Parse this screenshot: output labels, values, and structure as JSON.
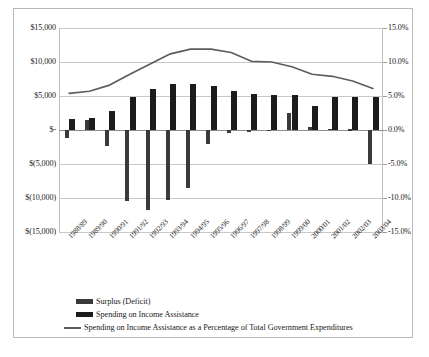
{
  "chart_data": {
    "type": "bar",
    "title": "",
    "xlabel": "",
    "ylabel": "",
    "categories": [
      "1988/89",
      "1989/90",
      "1990/91",
      "1991/92",
      "1992/93",
      "1993/94",
      "1994/95",
      "1995/96",
      "1996/97",
      "1997/98",
      "1998/99",
      "1999/00",
      "2000/01",
      "2001/02",
      "2002/03",
      "2003/04"
    ],
    "axes": {
      "left": {
        "label": "",
        "ylim": [
          -15000,
          15000
        ],
        "ticks": [
          15000,
          10000,
          5000,
          0,
          -5000,
          -10000,
          -15000
        ],
        "tick_labels": [
          "$15,000",
          "$10,000",
          "$5,000",
          "$-",
          "$(5,000)",
          "$(10,000)",
          "$(15,000)"
        ]
      },
      "right": {
        "label": "",
        "ylim": [
          -15,
          15
        ],
        "ticks": [
          15,
          10,
          5,
          0,
          -5,
          -10,
          -15
        ],
        "tick_labels": [
          "15.0%",
          "10.0%",
          "5.0%",
          "0.0%",
          "-5.0%",
          "-10.0%",
          "-15.0%"
        ]
      }
    },
    "grid": true,
    "legend_position": "bottom",
    "series": [
      {
        "name": "Surplus (Deficit)",
        "type": "bar",
        "axis": "left",
        "color": "#3a3a3a",
        "values": [
          -1200,
          1500,
          -2400,
          -10400,
          -11700,
          -10300,
          -8500,
          -2000,
          -380,
          -250,
          -170,
          2500,
          400,
          120,
          90,
          -5000
        ]
      },
      {
        "name": "Spending on Income Assistance",
        "type": "bar",
        "axis": "left",
        "color": "#1c1c1c",
        "values": [
          1600,
          1800,
          2800,
          4900,
          6100,
          6700,
          6800,
          6400,
          5700,
          5300,
          5200,
          5100,
          3600,
          4900,
          4800,
          4900
        ]
      },
      {
        "name": "Spending on Income Assistance as a Percentage of Total Government Expenditures",
        "type": "line",
        "axis": "right",
        "color": "#5d5d5d",
        "values": [
          5.4,
          5.7,
          6.6,
          8.2,
          9.7,
          11.2,
          11.9,
          11.9,
          11.4,
          10.1,
          10.0,
          9.3,
          8.2,
          7.9,
          7.2,
          6.1
        ]
      }
    ]
  }
}
